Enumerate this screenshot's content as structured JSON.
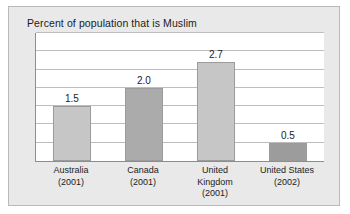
{
  "chart_data": {
    "type": "bar",
    "title": "Percent of population that is Muslim",
    "xlabel": "",
    "ylabel": "",
    "categories": [
      "Australia (2001)",
      "Canada (2001)",
      "United Kingdom (2001)",
      "United States (2002)"
    ],
    "category_lines": [
      [
        "Australia",
        "(2001)"
      ],
      [
        "Canada",
        "(2001)"
      ],
      [
        "United",
        "Kingdom",
        "(2001)"
      ],
      [
        "United States",
        "(2002)"
      ]
    ],
    "values": [
      1.5,
      2.0,
      2.7,
      0.5
    ],
    "value_labels": [
      "1.5",
      "2.0",
      "2.7",
      "0.5"
    ],
    "ylim": [
      0,
      3.5
    ],
    "gridlines": [
      0.5,
      1.0,
      1.5,
      2.0,
      2.5,
      3.0,
      3.5
    ],
    "grid": true,
    "legend": false,
    "bar_colors": [
      "#c6c6c6",
      "#ababab",
      "#c6c6c6",
      "#9c9c9c"
    ],
    "panel_background": "#e9e9e9",
    "plot_background": "#ffffff",
    "axis_color": "#8d8d8d",
    "grid_color": "#bdbdbd",
    "text_color": "#1c1c1c"
  }
}
